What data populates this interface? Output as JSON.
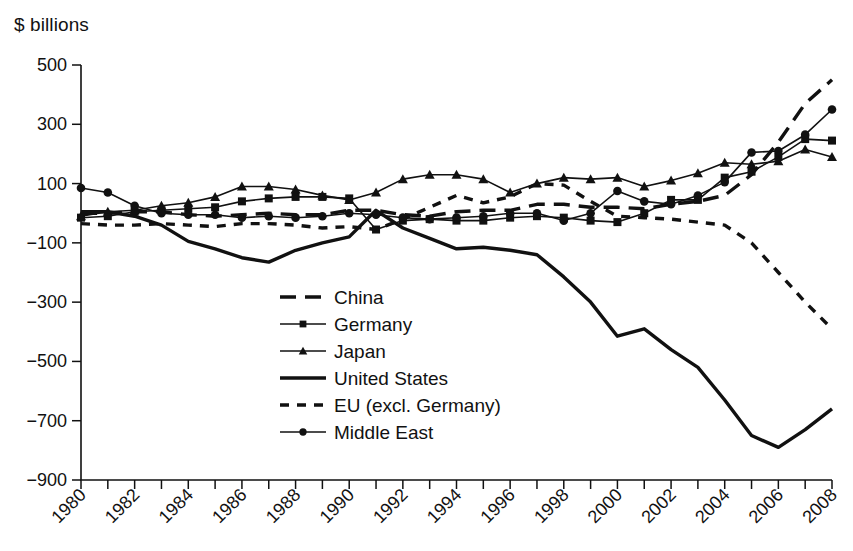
{
  "axis_unit_label": "$ billions",
  "chart_data": {
    "type": "line",
    "title": "",
    "xlabel": "",
    "ylabel": "$ billions",
    "ylim": [
      -900,
      500
    ],
    "xlim": [
      1980,
      2008
    ],
    "ytick_labels": [
      "500",
      "300",
      "100",
      "-100",
      "-300",
      "-500",
      "-700",
      "-900"
    ],
    "yticks": [
      500,
      300,
      100,
      -100,
      -300,
      -500,
      -700,
      -900
    ],
    "xtick_labels": [
      "1980",
      "1982",
      "1984",
      "1986",
      "1988",
      "1990",
      "1992",
      "1994",
      "1996",
      "1998",
      "2000",
      "2002",
      "2004",
      "2006",
      "2008"
    ],
    "xticks_labeled": [
      1980,
      1982,
      1984,
      1986,
      1988,
      1990,
      1992,
      1994,
      1996,
      1998,
      2000,
      2002,
      2004,
      2006,
      2008
    ],
    "xticks_all": [
      1980,
      1981,
      1982,
      1983,
      1984,
      1985,
      1986,
      1987,
      1988,
      1989,
      1990,
      1991,
      1992,
      1993,
      1994,
      1995,
      1996,
      1997,
      1998,
      1999,
      2000,
      2001,
      2002,
      2003,
      2004,
      2005,
      2006,
      2007,
      2008
    ],
    "grid": false,
    "legend_position": "center",
    "x": [
      1980,
      1981,
      1982,
      1983,
      1984,
      1985,
      1986,
      1987,
      1988,
      1989,
      1990,
      1991,
      1992,
      1993,
      1994,
      1995,
      1996,
      1997,
      1998,
      1999,
      2000,
      2001,
      2002,
      2003,
      2004,
      2005,
      2006,
      2007,
      2008
    ],
    "series": [
      {
        "name": "China",
        "style": "long-dash",
        "marker": "none",
        "values": [
          0,
          0,
          5,
          5,
          -5,
          -10,
          -5,
          0,
          -5,
          -5,
          10,
          10,
          -5,
          -10,
          5,
          10,
          10,
          30,
          30,
          20,
          20,
          15,
          30,
          40,
          60,
          130,
          240,
          370,
          450
        ]
      },
      {
        "name": "Germany",
        "style": "solid",
        "marker": "square",
        "values": [
          -15,
          -10,
          5,
          10,
          15,
          20,
          40,
          50,
          55,
          55,
          50,
          -55,
          -25,
          -20,
          -25,
          -25,
          -15,
          -10,
          -15,
          -25,
          -30,
          0,
          45,
          45,
          120,
          140,
          190,
          250,
          245
        ]
      },
      {
        "name": "Japan",
        "style": "solid",
        "marker": "triangle",
        "values": [
          -10,
          5,
          10,
          25,
          35,
          55,
          90,
          90,
          80,
          60,
          45,
          70,
          115,
          130,
          130,
          115,
          70,
          100,
          120,
          115,
          120,
          90,
          110,
          135,
          170,
          165,
          175,
          215,
          190
        ]
      },
      {
        "name": "United States",
        "style": "thick-solid",
        "marker": "none",
        "values": [
          5,
          5,
          -10,
          -40,
          -95,
          -120,
          -150,
          -165,
          -125,
          -100,
          -80,
          10,
          -50,
          -85,
          -120,
          -115,
          -125,
          -140,
          -215,
          -300,
          -415,
          -390,
          -460,
          -520,
          -630,
          -750,
          -790,
          -730,
          -660
        ]
      },
      {
        "name": "EU (excl. Germany)",
        "style": "short-dash",
        "marker": "none",
        "values": [
          -35,
          -40,
          -40,
          -35,
          -40,
          -45,
          -35,
          -35,
          -40,
          -50,
          -45,
          -55,
          -20,
          20,
          60,
          35,
          55,
          100,
          95,
          40,
          -10,
          -15,
          -20,
          -30,
          -40,
          -100,
          -200,
          -300,
          -390
        ]
      },
      {
        "name": "Middle East",
        "style": "solid",
        "marker": "circle",
        "values": [
          85,
          70,
          25,
          0,
          -5,
          -5,
          -15,
          -10,
          -15,
          -10,
          0,
          -5,
          -15,
          -20,
          -15,
          -10,
          0,
          0,
          -25,
          0,
          75,
          40,
          30,
          60,
          105,
          205,
          210,
          265,
          350
        ]
      }
    ]
  },
  "legend": {
    "items": [
      {
        "label": "China",
        "style": "long-dash",
        "marker": "none"
      },
      {
        "label": "Germany",
        "style": "solid",
        "marker": "square"
      },
      {
        "label": "Japan",
        "style": "solid",
        "marker": "triangle"
      },
      {
        "label": "United States",
        "style": "thick-solid",
        "marker": "none"
      },
      {
        "label": "EU (excl. Germany)",
        "style": "short-dash",
        "marker": "none"
      },
      {
        "label": "Middle East",
        "style": "solid",
        "marker": "circle"
      }
    ]
  }
}
